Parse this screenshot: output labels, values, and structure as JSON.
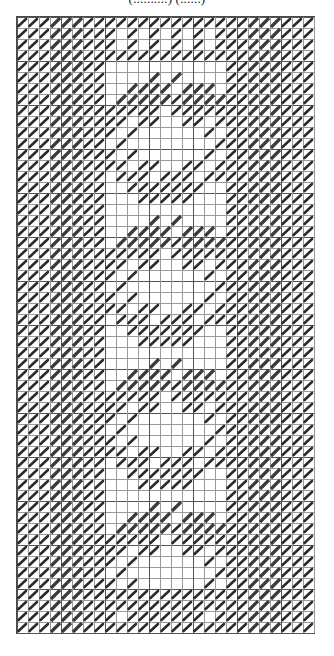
{
  "document": {
    "title_clipped": "(..........) (......)",
    "type": "needlepoint-chart",
    "description": "Monochrome needlepoint / cross-stitch pattern chart"
  },
  "chart_data": {
    "type": "heatmap",
    "title": "",
    "xlabel": "",
    "ylabel": "",
    "grid": true,
    "legend": "none",
    "columns": 27,
    "rows": 56,
    "cell_px": 11,
    "symbols": {
      "0": "empty",
      "1": "half-stitch-tent",
      "2": "solid-diagonal-band"
    },
    "colors": {
      "stitch": "#2b2b2b",
      "band": "#3a3a3a",
      "gridline": "#9a9a9a",
      "gridline_bold": "#555555",
      "background": "#ffffff"
    },
    "border": {
      "single_stitch_columns": [
        0,
        1,
        2,
        6,
        7
      ],
      "band_columns": [
        3,
        4,
        5
      ],
      "mirror": true,
      "top_rows": [
        0,
        1,
        2,
        3
      ],
      "bottom_rows": [
        52,
        53,
        54,
        55
      ]
    },
    "motif": {
      "name": "floral-wreath",
      "repeats": 4,
      "repeat_pitch_rows": 13,
      "first_row": 3,
      "center_column": 13,
      "width_cells": 13,
      "height_cells": 12
    },
    "values_note": "Dense monochrome tent-stitch chart; interior shows four identical circular wreath motifs each topped by two diagonal leaf bands."
  }
}
